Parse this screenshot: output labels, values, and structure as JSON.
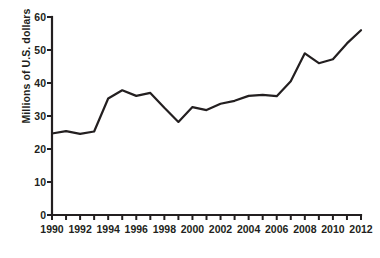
{
  "chart_data": {
    "type": "line",
    "title": "",
    "subtitle": "",
    "xlabel": "",
    "ylabel": "Millions of U.S. dollars",
    "xlim": [
      1990,
      2012
    ],
    "ylim": [
      0,
      60
    ],
    "grid": false,
    "legend": false,
    "legend_position": "none",
    "line_color": "#231f20",
    "x": [
      1990,
      1991,
      1992,
      1993,
      1994,
      1995,
      1996,
      1997,
      1998,
      1999,
      2000,
      2001,
      2002,
      2003,
      2004,
      2005,
      2006,
      2007,
      2008,
      2009,
      2010,
      2011,
      2012
    ],
    "series": [
      {
        "name": "Millions of U.S. dollars",
        "values": [
          24.7,
          25.4,
          24.6,
          25.3,
          35.3,
          37.8,
          36.1,
          37.0,
          32.5,
          28.2,
          32.7,
          31.8,
          33.7,
          34.6,
          36.1,
          36.4,
          36.0,
          40.5,
          49.0,
          46.0,
          47.2,
          52.0,
          56.0
        ]
      }
    ],
    "x_tick_labels": [
      "1990",
      "1992",
      "1994",
      "1996",
      "1998",
      "2000",
      "2002",
      "2004",
      "2006",
      "2008",
      "2010",
      "2012"
    ],
    "x_tick_values": [
      1990,
      1992,
      1994,
      1996,
      1998,
      2000,
      2002,
      2004,
      2006,
      2008,
      2010,
      2012
    ],
    "x_minor_tick_values": [
      1991,
      1993,
      1995,
      1997,
      1999,
      2001,
      2003,
      2005,
      2007,
      2009,
      2011
    ],
    "y_tick_labels": [
      "0",
      "10",
      "20",
      "30",
      "40",
      "50",
      "60"
    ],
    "y_tick_values": [
      0,
      10,
      20,
      30,
      40,
      50,
      60
    ],
    "axis_color": "#231f20",
    "background_color": "#ffffff"
  }
}
